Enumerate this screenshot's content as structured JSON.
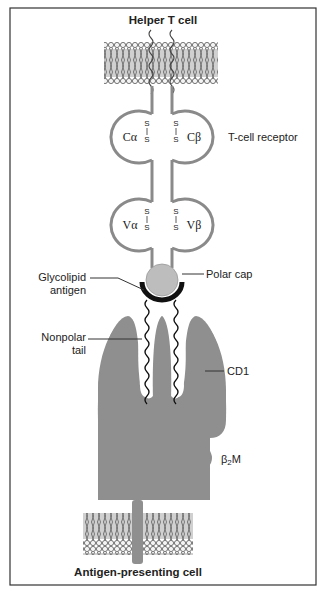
{
  "title_top": "Helper T cell",
  "title_bottom": "Antigen-presenting cell",
  "labels": {
    "tcr": "T-cell receptor",
    "c_alpha": "Cα",
    "c_beta": "Cβ",
    "v_alpha": "Vα",
    "v_beta": "Vβ",
    "disulfide": "S",
    "polar_cap": "Polar cap",
    "glycolipid_line1": "Glycolipid",
    "glycolipid_line2": "antigen",
    "nonpolar_line1": "Nonpolar",
    "nonpolar_line2": "tail",
    "cd1": "CD1",
    "b2m_beta": "β",
    "b2m_sub": "2",
    "b2m_m": "M"
  },
  "colors": {
    "protein": "#8f8f8f",
    "tcr_outline": "#8a8a8a",
    "polar_cap": "#bdbdbd",
    "antigen_arc": "#111111",
    "membrane": "#6d6d6d",
    "frame": "#333333"
  }
}
